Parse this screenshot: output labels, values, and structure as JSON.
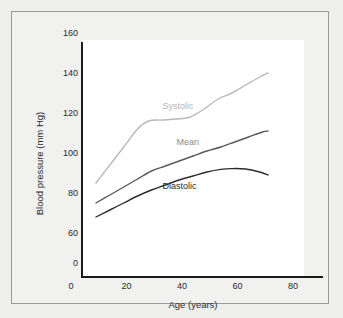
{
  "figure": {
    "background_color": "#efefee",
    "plot_background_color": "#ffffff",
    "border_color": "#9a9a9a",
    "axis_color": "#1a1a1a"
  },
  "chart_data": {
    "type": "line",
    "title": "",
    "xlabel": "Age (years)",
    "ylabel": "Blood pressure (mm Hg)",
    "xlim": [
      0,
      80
    ],
    "ylim": [
      60,
      160
    ],
    "xticks": [
      0,
      20,
      40,
      60,
      80
    ],
    "yticks": [
      0,
      60,
      80,
      100,
      120,
      140,
      160
    ],
    "y_axis_broken": true,
    "y_axis_break_note": "axis origin labelled 0, scale resumes at 60",
    "grid": false,
    "legend_position": "inline-labels",
    "series": [
      {
        "name": "Systolic",
        "color": "#b9b9b9",
        "label_color": "#b4b4b4",
        "label_x": 33,
        "label_y": 123,
        "x": [
          9,
          14,
          19,
          24,
          28,
          33,
          38,
          43,
          48,
          53,
          58,
          63,
          68,
          71
        ],
        "y": [
          85,
          94,
          103,
          112,
          116,
          116.5,
          117,
          118,
          122,
          127,
          130,
          134,
          138,
          140
        ]
      },
      {
        "name": "Mean",
        "color": "#595959",
        "label_color": "#8a8a8a",
        "label_x": 38,
        "label_y": 105,
        "x": [
          9,
          14,
          19,
          24,
          29,
          34,
          39,
          44,
          49,
          54,
          59,
          64,
          69,
          71
        ],
        "y": [
          75,
          79,
          83,
          87,
          91,
          93.5,
          96,
          98.5,
          101,
          103,
          105.5,
          108,
          110.5,
          111
        ]
      },
      {
        "name": "Diastolic",
        "color": "#2b2b2b",
        "label_color": "#2b2b2b",
        "label_x": 33,
        "label_y": 83,
        "x": [
          9,
          14,
          19,
          24,
          29,
          34,
          39,
          44,
          49,
          54,
          58,
          63,
          68,
          71
        ],
        "y": [
          68,
          71.5,
          75,
          78.5,
          81.5,
          84,
          86.5,
          88.5,
          90.5,
          91.8,
          92.2,
          92,
          90.5,
          89
        ]
      }
    ]
  }
}
